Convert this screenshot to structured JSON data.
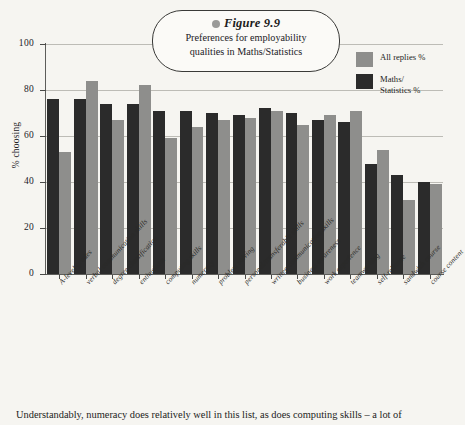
{
  "figure": {
    "label": "Figure 9.9",
    "bullet_icon": "bullet-dot",
    "subtitle_line1": "Preferences for employability",
    "subtitle_line2": "qualities in Maths/Statistics"
  },
  "legend": {
    "position": "top-right",
    "entries": [
      {
        "label": "All replies %",
        "color": "#8e8e8c"
      },
      {
        "label_line1": "Maths/",
        "label_line2": "Statistics %",
        "color": "#2b2b2b"
      }
    ]
  },
  "axis": {
    "ylabel": "% choosing",
    "yticks": [
      "100",
      "80",
      "60",
      "40",
      "20",
      "0"
    ]
  },
  "caption": "Understandably, numeracy does relatively well in this list, as does computing skills – a lot of",
  "chart_data": {
    "type": "bar",
    "title": "Preferences for employability qualities in Maths/Statistics",
    "xlabel": "",
    "ylabel": "% choosing",
    "ylim": [
      0,
      100
    ],
    "yticks": [
      0,
      20,
      40,
      60,
      80,
      100
    ],
    "grid": true,
    "legend_position": "top-right",
    "categories": [
      "A-level grades",
      "verbal communication skills",
      "degree classification",
      "enthusiasm",
      "computing skills",
      "numeracy",
      "problem solving",
      "personal/transferable skills",
      "written communication skills",
      "business awareness",
      "work experience",
      "teamworking",
      "self-reliance",
      "sandwich course",
      "course content"
    ],
    "series": [
      {
        "name": "Maths/Statistics %",
        "color": "#2b2b2b",
        "values": [
          76,
          76,
          74,
          74,
          71,
          71,
          70,
          69,
          72,
          70,
          67,
          66,
          48,
          43,
          40
        ]
      },
      {
        "name": "All replies %",
        "color": "#8e8e8c",
        "values": [
          53,
          84,
          67,
          82,
          59,
          64,
          67,
          68,
          71,
          65,
          69,
          71,
          54,
          32,
          39
        ]
      }
    ]
  }
}
